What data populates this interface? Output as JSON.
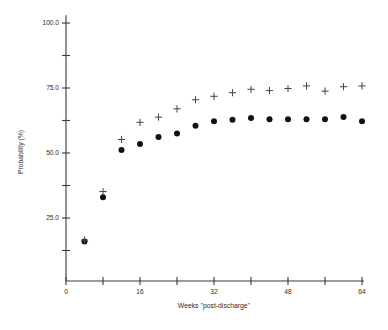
{
  "chart_data": {
    "type": "scatter",
    "title": "",
    "xlabel": "Weeks ''post-discharge''",
    "ylabel": "Probability (%)",
    "xlim": [
      0,
      68
    ],
    "ylim": [
      5,
      103
    ],
    "grid": false,
    "legend": "none",
    "x_ticks_major": [
      0,
      16,
      32,
      48,
      64
    ],
    "x_ticklabels": [
      "0",
      "16",
      "32",
      "48",
      "64"
    ],
    "x_ticks_minor": [
      8,
      24,
      40,
      56
    ],
    "y_ticks_major": [
      25.0,
      50.0,
      75.0,
      100.0
    ],
    "y_ticklabels": [
      "25.0",
      "50.0",
      "75.0",
      "100.0"
    ],
    "y_ticks_minor": [
      12.5,
      37.5,
      62.5,
      87.5
    ],
    "x": [
      4,
      8,
      12,
      16,
      20,
      24,
      28,
      32,
      36,
      40,
      44,
      48,
      52,
      56,
      60,
      64
    ],
    "series": [
      {
        "name": "filled-circle-series",
        "marker": "circle",
        "values": [
          16.0,
          33.0,
          51.2,
          53.5,
          56.2,
          57.5,
          60.5,
          62.2,
          62.8,
          63.5,
          63.0,
          63.0,
          63.0,
          63.0,
          63.8,
          62.2
        ]
      },
      {
        "name": "plus-series",
        "marker": "plus",
        "values": [
          16.5,
          35.2,
          55.2,
          61.8,
          63.8,
          67.0,
          70.5,
          71.8,
          73.2,
          74.5,
          74.0,
          74.8,
          75.8,
          73.8,
          75.5,
          75.8
        ]
      }
    ]
  },
  "colors": {
    "axis": "#3a3a3a",
    "dot": "#111111",
    "plus": "#4a4a4a",
    "background": "#ffffff",
    "text": "#2b2b2b"
  }
}
